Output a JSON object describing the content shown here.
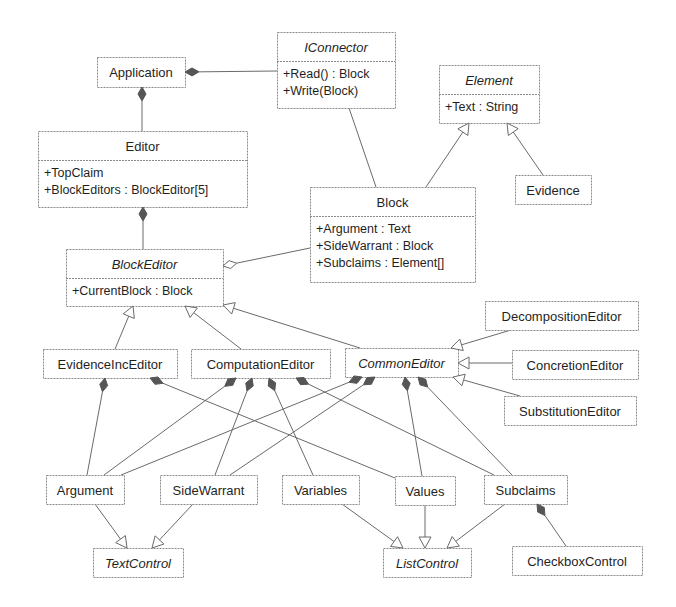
{
  "diagram": {
    "type": "UML class diagram",
    "classes": [
      {
        "id": "Application",
        "name": "Application",
        "abstract": false,
        "attributes": [],
        "box": [
          97,
          57,
          88,
          30
        ]
      },
      {
        "id": "IConnector",
        "name": "IConnector",
        "abstract": true,
        "attributes": [
          "+Read() : Block",
          "+Write(Block)"
        ],
        "box": [
          277,
          32,
          118,
          76
        ],
        "header": 29
      },
      {
        "id": "Element",
        "name": "Element",
        "abstract": true,
        "attributes": [
          "+Text : String"
        ],
        "box": [
          439,
          65,
          100,
          58
        ],
        "header": 29
      },
      {
        "id": "Editor",
        "name": "Editor",
        "abstract": false,
        "attributes": [
          "+TopClaim",
          "+BlockEditors : BlockEditor[5]"
        ],
        "box": [
          38,
          131,
          209,
          76
        ],
        "header": 29
      },
      {
        "id": "Block",
        "name": "Block",
        "abstract": false,
        "attributes": [
          "+Argument : Text",
          "+SideWarrant : Block",
          "+Subclaims : Element[]"
        ],
        "box": [
          310,
          187,
          165,
          95
        ],
        "header": 29
      },
      {
        "id": "Evidence",
        "name": "Evidence",
        "abstract": false,
        "attributes": [],
        "box": [
          515,
          175,
          76,
          29
        ]
      },
      {
        "id": "BlockEditor",
        "name": "BlockEditor",
        "abstract": true,
        "attributes": [
          "+CurrentBlock : Block"
        ],
        "box": [
          66,
          249,
          157,
          57
        ],
        "header": 29
      },
      {
        "id": "DecompositionEditor",
        "name": "DecompositionEditor",
        "abstract": false,
        "attributes": [],
        "box": [
          485,
          301,
          153,
          29
        ]
      },
      {
        "id": "EvidenceIncEditor",
        "name": "EvidenceIncEditor",
        "abstract": false,
        "attributes": [],
        "box": [
          43,
          349,
          134,
          29
        ]
      },
      {
        "id": "ComputationEditor",
        "name": "ComputationEditor",
        "abstract": false,
        "attributes": [],
        "box": [
          191,
          349,
          139,
          29
        ]
      },
      {
        "id": "CommonEditor",
        "name": "CommonEditor",
        "abstract": true,
        "attributes": [],
        "box": [
          345,
          348,
          113,
          29
        ]
      },
      {
        "id": "ConcretionEditor",
        "name": "ConcretionEditor",
        "abstract": false,
        "attributes": [],
        "box": [
          512,
          350,
          126,
          29
        ]
      },
      {
        "id": "SubstitutionEditor",
        "name": "SubstitutionEditor",
        "abstract": false,
        "attributes": [],
        "box": [
          504,
          396,
          132,
          29
        ]
      },
      {
        "id": "Argument",
        "name": "Argument",
        "abstract": false,
        "attributes": [],
        "box": [
          46,
          475,
          78,
          29
        ]
      },
      {
        "id": "SideWarrant",
        "name": "SideWarrant",
        "abstract": false,
        "attributes": [],
        "box": [
          160,
          475,
          97,
          29
        ]
      },
      {
        "id": "Variables",
        "name": "Variables",
        "abstract": false,
        "attributes": [],
        "box": [
          282,
          475,
          77,
          29
        ]
      },
      {
        "id": "Values",
        "name": "Values",
        "abstract": false,
        "attributes": [],
        "box": [
          395,
          476,
          60,
          29
        ]
      },
      {
        "id": "Subclaims",
        "name": "Subclaims",
        "abstract": false,
        "attributes": [],
        "box": [
          484,
          475,
          83,
          29
        ]
      },
      {
        "id": "TextControl",
        "name": "TextControl",
        "abstract": true,
        "attributes": [],
        "box": [
          93,
          548,
          90,
          29
        ]
      },
      {
        "id": "ListControl",
        "name": "ListControl",
        "abstract": true,
        "attributes": [],
        "box": [
          383,
          548,
          88,
          29
        ]
      },
      {
        "id": "CheckboxControl",
        "name": "CheckboxControl",
        "abstract": false,
        "attributes": [],
        "box": [
          512,
          546,
          130,
          29
        ]
      }
    ],
    "relations": [
      {
        "kind": "composition",
        "whole": "Application",
        "part": "IConnector",
        "from": [
          185,
          72
        ],
        "to": [
          277,
          71
        ]
      },
      {
        "kind": "composition",
        "whole": "Application",
        "part": "Editor",
        "from": [
          142,
          87
        ],
        "to": [
          142,
          131
        ]
      },
      {
        "kind": "association",
        "a": "IConnector",
        "b": "Block",
        "from": [
          349,
          108
        ],
        "to": [
          376,
          187
        ]
      },
      {
        "kind": "generalization",
        "child": "Block",
        "parent": "Element",
        "from": [
          426,
          187
        ],
        "to": [
          469,
          123
        ]
      },
      {
        "kind": "generalization",
        "child": "Evidence",
        "parent": "Element",
        "from": [
          543,
          175
        ],
        "to": [
          507,
          123
        ]
      },
      {
        "kind": "composition",
        "whole": "Editor",
        "part": "BlockEditor",
        "from": [
          143,
          207
        ],
        "to": [
          143,
          249
        ]
      },
      {
        "kind": "aggregation",
        "whole": "BlockEditor",
        "part": "Block",
        "from": [
          223,
          266
        ],
        "to": [
          310,
          248
        ]
      },
      {
        "kind": "generalization",
        "child": "EvidenceIncEditor",
        "parent": "BlockEditor",
        "from": [
          115,
          349
        ],
        "to": [
          133,
          306
        ]
      },
      {
        "kind": "generalization",
        "child": "ComputationEditor",
        "parent": "BlockEditor",
        "from": [
          241,
          349
        ],
        "to": [
          185,
          306
        ]
      },
      {
        "kind": "generalization",
        "child": "CommonEditor",
        "parent": "BlockEditor",
        "from": [
          360,
          348
        ],
        "to": [
          223,
          305
        ]
      },
      {
        "kind": "generalization",
        "child": "DecompositionEditor",
        "parent": "CommonEditor",
        "from": [
          511,
          330
        ],
        "to": [
          451,
          348
        ]
      },
      {
        "kind": "generalization",
        "child": "ConcretionEditor",
        "parent": "CommonEditor",
        "from": [
          512,
          363
        ],
        "to": [
          458,
          363
        ]
      },
      {
        "kind": "generalization",
        "child": "SubstitutionEditor",
        "parent": "CommonEditor",
        "from": [
          520,
          396
        ],
        "to": [
          453,
          377
        ]
      },
      {
        "kind": "composition",
        "whole": "EvidenceIncEditor",
        "part": "Argument",
        "from": [
          105,
          378
        ],
        "to": [
          87,
          475
        ]
      },
      {
        "kind": "composition",
        "whole": "EvidenceIncEditor",
        "part": "Values",
        "from": [
          150,
          378
        ],
        "to": [
          395,
          478
        ]
      },
      {
        "kind": "composition",
        "whole": "ComputationEditor",
        "part": "Argument",
        "from": [
          236,
          378
        ],
        "to": [
          104,
          475
        ]
      },
      {
        "kind": "composition",
        "whole": "ComputationEditor",
        "part": "SideWarrant",
        "from": [
          252,
          378
        ],
        "to": [
          215,
          475
        ]
      },
      {
        "kind": "composition",
        "whole": "ComputationEditor",
        "part": "Variables",
        "from": [
          269,
          378
        ],
        "to": [
          313,
          475
        ]
      },
      {
        "kind": "composition",
        "whole": "ComputationEditor",
        "part": "Subclaims",
        "from": [
          296,
          378
        ],
        "to": [
          494,
          475
        ]
      },
      {
        "kind": "composition",
        "whole": "CommonEditor",
        "part": "Argument",
        "from": [
          362,
          377
        ],
        "to": [
          121,
          475
        ]
      },
      {
        "kind": "composition",
        "whole": "CommonEditor",
        "part": "SideWarrant",
        "from": [
          375,
          377
        ],
        "to": [
          230,
          475
        ]
      },
      {
        "kind": "composition",
        "whole": "CommonEditor",
        "part": "Values",
        "from": [
          405,
          377
        ],
        "to": [
          422,
          476
        ]
      },
      {
        "kind": "composition",
        "whole": "CommonEditor",
        "part": "Subclaims",
        "from": [
          418,
          377
        ],
        "to": [
          512,
          475
        ]
      },
      {
        "kind": "generalization",
        "child": "Argument",
        "parent": "TextControl",
        "from": [
          95,
          504
        ],
        "to": [
          127,
          548
        ]
      },
      {
        "kind": "generalization",
        "child": "SideWarrant",
        "parent": "TextControl",
        "from": [
          193,
          504
        ],
        "to": [
          152,
          548
        ]
      },
      {
        "kind": "generalization",
        "child": "Variables",
        "parent": "ListControl",
        "from": [
          342,
          504
        ],
        "to": [
          403,
          548
        ]
      },
      {
        "kind": "generalization",
        "child": "Values",
        "parent": "ListControl",
        "from": [
          425,
          505
        ],
        "to": [
          425,
          548
        ]
      },
      {
        "kind": "generalization",
        "child": "Subclaims",
        "parent": "ListControl",
        "from": [
          505,
          504
        ],
        "to": [
          447,
          548
        ]
      },
      {
        "kind": "composition",
        "whole": "Subclaims",
        "part": "CheckboxControl",
        "from": [
          537,
          504
        ],
        "to": [
          566,
          546
        ]
      }
    ]
  },
  "colors": {
    "background": "#ffffff",
    "line": "#6a6a6a",
    "box_border": "#8a8a8a",
    "text": "#1f1f1f",
    "filled_diamond": "#555555"
  }
}
